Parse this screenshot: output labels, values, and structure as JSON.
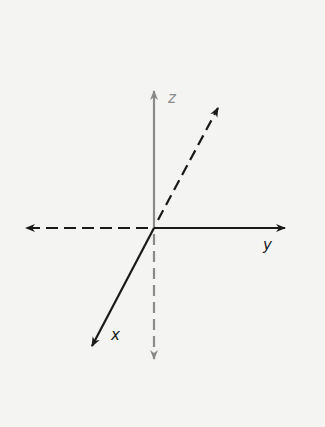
{
  "diagram": {
    "title": "",
    "type": "3d-coordinate-axes",
    "colors": {
      "background": "#f4f4f2",
      "primary_axis": "#1a1a1a",
      "vertical_axis": "#8a8a8a"
    },
    "axes": [
      {
        "label": "z",
        "direction": "up",
        "style": "solid",
        "color": "#8a8a8a"
      },
      {
        "label": "y",
        "direction": "right",
        "style": "solid",
        "color": "#1a1a1a"
      },
      {
        "label": "x",
        "direction": "down-left",
        "style": "solid",
        "color": "#1a1a1a"
      }
    ],
    "negative_axes": [
      {
        "of": "z",
        "direction": "down",
        "style": "dashed",
        "color": "#8a8a8a"
      },
      {
        "of": "y",
        "direction": "left",
        "style": "dashed",
        "color": "#1a1a1a"
      },
      {
        "of": "x",
        "direction": "up-right",
        "style": "dashed",
        "color": "#1a1a1a"
      }
    ],
    "labels": {
      "z": "z",
      "y": "y",
      "x": "x"
    }
  }
}
